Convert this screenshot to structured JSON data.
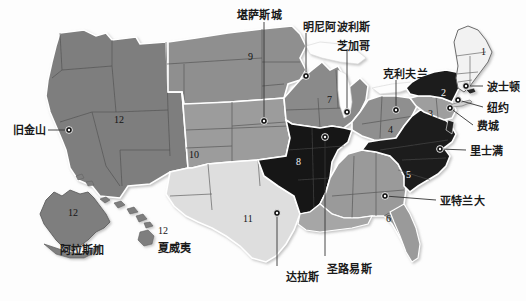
{
  "map": {
    "title": "美国联邦储备区地图",
    "background_color": "#fdfdfd",
    "border_color": "#ffffff",
    "outline_color": "#6b6b6b",
    "marker_color": "#111111",
    "leader_line_color": "#333333",
    "palette": {
      "very_dark": "#161616",
      "dark": "#4a4a4a",
      "mid_dark": "#6e6e6e",
      "mid": "#8f8f8f",
      "mid_light": "#a9a9a9",
      "light": "#c8c8c8",
      "very_light": "#e3e3e3",
      "near_white": "#f1f1f1"
    }
  },
  "cities": [
    {
      "name": "city-kansas-city",
      "label": "堪萨斯城",
      "label_x": 237,
      "label_y": 10,
      "dot_x": 264,
      "dot_y": 121,
      "line": "v",
      "anchor_x": 264,
      "anchor_y": 22
    },
    {
      "name": "city-minneapolis",
      "label": "明尼阿波利斯",
      "label_x": 303,
      "label_y": 22,
      "dot_x": 306,
      "dot_y": 76,
      "line": "v",
      "anchor_x": 306,
      "anchor_y": 33
    },
    {
      "name": "city-chicago",
      "label": "芝加哥",
      "label_x": 337,
      "label_y": 41,
      "dot_x": 347,
      "dot_y": 112,
      "line": "v",
      "anchor_x": 347,
      "anchor_y": 51
    },
    {
      "name": "city-cleveland",
      "label": "克利夫兰",
      "label_x": 383,
      "label_y": 69,
      "dot_x": 396,
      "dot_y": 110,
      "line": "v",
      "anchor_x": 396,
      "anchor_y": 80
    },
    {
      "name": "city-boston",
      "label": "波士顿",
      "label_x": 487,
      "label_y": 82,
      "dot_x": 466,
      "dot_y": 86,
      "line": "h",
      "anchor_x": 483,
      "anchor_y": 86
    },
    {
      "name": "city-new-york",
      "label": "纽约",
      "label_x": 487,
      "label_y": 103,
      "dot_x": 458,
      "dot_y": 100,
      "line": "h",
      "anchor_x": 483,
      "anchor_y": 107
    },
    {
      "name": "city-philadelphia",
      "label": "费城",
      "label_x": 477,
      "label_y": 121,
      "dot_x": 450,
      "dot_y": 108,
      "line": "h",
      "anchor_x": 473,
      "anchor_y": 125
    },
    {
      "name": "city-richmond",
      "label": "里士满",
      "label_x": 470,
      "label_y": 146,
      "dot_x": 440,
      "dot_y": 149,
      "line": "h",
      "anchor_x": 466,
      "anchor_y": 150
    },
    {
      "name": "city-atlanta",
      "label": "亚特兰大",
      "label_x": 440,
      "label_y": 196,
      "dot_x": 385,
      "dot_y": 196,
      "line": "h",
      "anchor_x": 436,
      "anchor_y": 200
    },
    {
      "name": "city-san-francisco",
      "label": "旧金山",
      "label_x": 13,
      "label_y": 125,
      "dot_x": 69,
      "dot_y": 130,
      "line": "h",
      "anchor_x": 48,
      "anchor_y": 130
    },
    {
      "name": "city-dallas",
      "label": "达拉斯",
      "label_x": 286,
      "label_y": 272,
      "dot_x": 277,
      "dot_y": 213,
      "line": "v",
      "anchor_x": 277,
      "anchor_y": 266
    },
    {
      "name": "city-st-louis",
      "label": "圣路易斯",
      "label_x": 327,
      "label_y": 264,
      "dot_x": 325,
      "dot_y": 137,
      "line": "v",
      "anchor_x": 325,
      "anchor_y": 256
    }
  ],
  "places": [
    {
      "name": "place-alaska",
      "label": "阿拉斯加",
      "x": 60,
      "y": 245
    },
    {
      "name": "place-hawaii",
      "label": "夏威夷",
      "x": 158,
      "y": 243
    }
  ],
  "districts": [
    {
      "name": "district-1",
      "number": "1",
      "x": 481,
      "y": 47,
      "tone": "on-mid"
    },
    {
      "name": "district-2",
      "number": "2",
      "x": 441,
      "y": 88,
      "tone": "on-dark"
    },
    {
      "name": "district-3",
      "number": "3",
      "x": 428,
      "y": 109,
      "tone": "on-mid"
    },
    {
      "name": "district-4",
      "number": "4",
      "x": 388,
      "y": 125,
      "tone": "on-mid"
    },
    {
      "name": "district-5",
      "number": "5",
      "x": 406,
      "y": 170,
      "tone": "on-dark"
    },
    {
      "name": "district-6",
      "number": "6",
      "x": 386,
      "y": 214,
      "tone": "on-mid"
    },
    {
      "name": "district-7",
      "number": "7",
      "x": 327,
      "y": 95,
      "tone": "on-mid"
    },
    {
      "name": "district-8",
      "number": "8",
      "x": 296,
      "y": 157,
      "tone": "on-dark"
    },
    {
      "name": "district-9",
      "number": "9",
      "x": 248,
      "y": 52,
      "tone": "on-mid"
    },
    {
      "name": "district-10",
      "number": "10",
      "x": 189,
      "y": 150,
      "tone": "on-mid"
    },
    {
      "name": "district-11",
      "number": "11",
      "x": 243,
      "y": 214,
      "tone": "on-mid"
    },
    {
      "name": "district-12-west",
      "number": "12",
      "x": 114,
      "y": 115,
      "tone": "on-mid"
    },
    {
      "name": "district-12-alaska",
      "number": "12",
      "x": 68,
      "y": 208,
      "tone": "on-mid"
    },
    {
      "name": "district-12-hawaii",
      "number": "12",
      "x": 158,
      "y": 226,
      "tone": "on-mid"
    }
  ]
}
